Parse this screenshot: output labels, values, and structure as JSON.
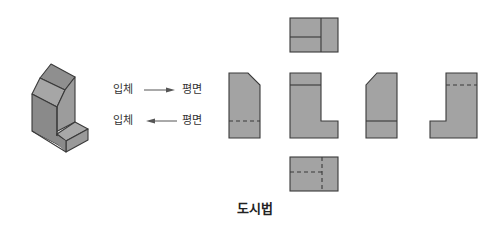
{
  "diagram": {
    "caption": "도시법",
    "colors": {
      "face_fill": "#a3a3a3",
      "iso_top": "#9a9a9a",
      "iso_front": "#8d8d8d",
      "iso_side": "#9e9e9e",
      "outline": "#3a3a3a",
      "text": "#333333",
      "background": "#ffffff"
    },
    "relations": [
      {
        "from": "입체",
        "to": "평면",
        "arrow": "right-arrow"
      },
      {
        "from": "입체",
        "to": "평면",
        "arrow": "left-arrow"
      }
    ],
    "isometric_object": {
      "name": "L-shaped block with chamfered top"
    },
    "views": [
      {
        "id": "top-view",
        "position": "top-center",
        "lines": [
          "solid-horizontal",
          "solid-vertical"
        ]
      },
      {
        "id": "left-side-view",
        "position": "middle-left",
        "lines": [
          "hidden-horizontal"
        ]
      },
      {
        "id": "front-view",
        "position": "center",
        "lines": [
          "solid-horizontal"
        ]
      },
      {
        "id": "right-side-view",
        "position": "middle-right",
        "lines": [
          "solid-horizontal"
        ]
      },
      {
        "id": "rear-view",
        "position": "far-right",
        "lines": [
          "hidden-horizontal"
        ]
      },
      {
        "id": "bottom-view",
        "position": "bottom-center",
        "lines": [
          "hidden-horizontal",
          "hidden-vertical"
        ]
      }
    ]
  }
}
